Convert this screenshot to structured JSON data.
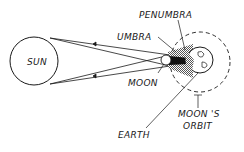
{
  "diagram": {
    "type": "solar-eclipse",
    "labels": {
      "sun": "SUN",
      "penumbra": "PENUMBRA",
      "umbra": "UMBRA",
      "moon": "MOON",
      "earth": "EARTH",
      "moons_orbit_line1": "MOON 'S",
      "moons_orbit_line2": "ORBIT"
    },
    "colors": {
      "stroke": "#1a1a1a",
      "umbra": "#111111",
      "penumbra": "#8a8a8a",
      "background": "#ffffff"
    }
  }
}
